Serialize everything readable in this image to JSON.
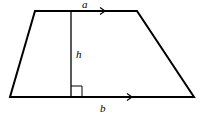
{
  "diagram": {
    "type": "trapezoid",
    "labels": {
      "top_side": "a",
      "bottom_side": "b",
      "height": "h"
    },
    "vertices": {
      "top_left": [
        35,
        11
      ],
      "top_right": [
        137,
        11
      ],
      "bottom_right": [
        194,
        97
      ],
      "bottom_left": [
        10,
        97
      ]
    },
    "height_line": {
      "x": 71,
      "y1": 11,
      "y2": 97
    },
    "parallel_markers": [
      "top-side-arrow",
      "bottom-side-arrow"
    ],
    "stroke_color": "#000000",
    "background_color": "#ffffff"
  }
}
